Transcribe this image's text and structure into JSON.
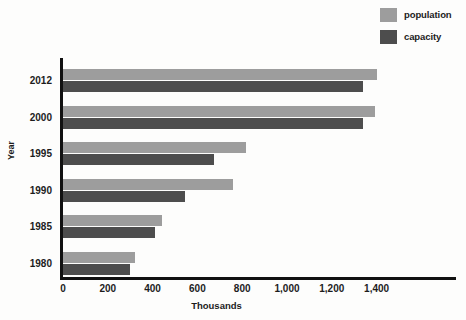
{
  "chart_data": {
    "type": "bar",
    "orientation": "horizontal",
    "title": "",
    "xlabel": "Thousands",
    "ylabel": "Year",
    "categories": [
      "2012",
      "2000",
      "1995",
      "1990",
      "1985",
      "1980"
    ],
    "series": [
      {
        "name": "population",
        "color": "#9d9d9d",
        "values": [
          1400,
          1395,
          815,
          760,
          440,
          320
        ]
      },
      {
        "name": "capacity",
        "color": "#4d4d4d",
        "values": [
          1340,
          1340,
          675,
          545,
          410,
          300
        ]
      }
    ],
    "xlim": [
      0,
      1500
    ],
    "xticks": [
      0,
      200,
      400,
      600,
      800,
      1000,
      1200,
      1400
    ],
    "xtick_labels": [
      "0",
      "200",
      "400",
      "600",
      "800",
      "1,000",
      "1,200",
      "1,400"
    ],
    "grid": false,
    "legend_position": "top-right"
  },
  "legend": {
    "items": [
      {
        "label": "population",
        "color": "#9d9d9d"
      },
      {
        "label": "capacity",
        "color": "#4d4d4d"
      }
    ]
  },
  "axes": {
    "y_title": "Year",
    "x_title": "Thousands",
    "axis_color": "#111111"
  }
}
